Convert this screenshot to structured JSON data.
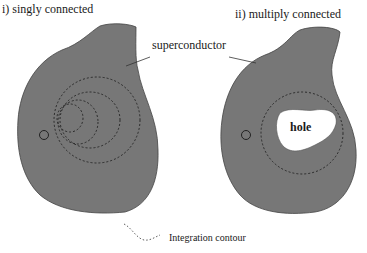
{
  "panels": [
    {
      "title": "i) singly connected",
      "origin_label": "O"
    },
    {
      "title": "ii) multiply connected",
      "origin_label": "O",
      "hole_label": "hole"
    }
  ],
  "shared_label": "superconductor",
  "legend": {
    "label": "Integration contour",
    "icon": "dashed-curve-icon"
  },
  "colors": {
    "superconductor_fill": "#777777",
    "hole_fill": "#ffffff",
    "contour": "#222222"
  }
}
